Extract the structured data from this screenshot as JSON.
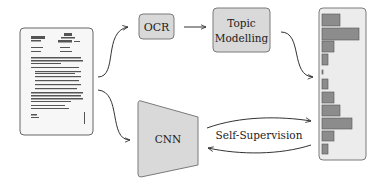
{
  "diagram": {
    "nodes": {
      "document": {
        "label": "Scanned document",
        "type": "image"
      },
      "ocr": {
        "label": "OCR"
      },
      "topic": {
        "line1": "Topic",
        "line2": "Modelling"
      },
      "cnn": {
        "label": "CNN"
      },
      "histogram": {
        "label": "Topic distribution"
      }
    },
    "edges": [
      {
        "from": "document",
        "to": "ocr"
      },
      {
        "from": "ocr",
        "to": "topic"
      },
      {
        "from": "topic",
        "to": "histogram"
      },
      {
        "from": "document",
        "to": "cnn"
      },
      {
        "from": "cnn",
        "to": "histogram",
        "label": "Self-Supervision",
        "bidirectional": true
      }
    ],
    "edge_label": "Self-Supervision",
    "histogram_bars": [
      18,
      37,
      12,
      6,
      1,
      6,
      12,
      18,
      30,
      12,
      6
    ],
    "colors": {
      "box_fill": "#d9d9d9",
      "box_stroke": "#7a7a7a",
      "bar_fill": "#8c8c8c",
      "bar_stroke": "#555555",
      "panel_fill": "#e8e8e8",
      "arrow": "#333333"
    }
  }
}
